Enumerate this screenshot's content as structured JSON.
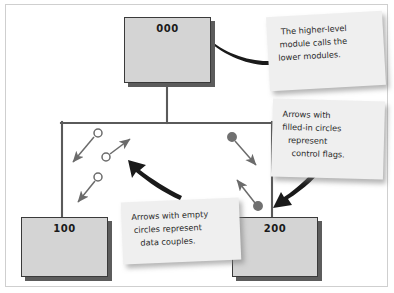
{
  "diagram": {
    "colors": {
      "box_fill": "#d4d4d4",
      "box_border": "#3a3a3a",
      "box_shadow": "#5c5c5c",
      "note_fill": "#efefef",
      "connector": "#5a5a5a",
      "callout_arrow": "#1a1a1a",
      "coupling_arrow": "#6b6b6b",
      "filled_circle": "#707070",
      "empty_circle": "#ffffff"
    },
    "modules": [
      {
        "id": "module-000",
        "label": "000",
        "x": 124,
        "y": 17,
        "w": 87,
        "h": 66
      },
      {
        "id": "module-100",
        "label": "100",
        "x": 21,
        "y": 217,
        "w": 87,
        "h": 60
      },
      {
        "id": "module-200",
        "label": "200",
        "x": 232,
        "y": 217,
        "w": 86,
        "h": 60
      }
    ],
    "connectors": [
      {
        "name": "parent-stem",
        "from": [
          167,
          83
        ],
        "to": [
          167,
          123
        ]
      },
      {
        "name": "horizontal-bus",
        "from": [
          62,
          123
        ],
        "to": [
          272,
          123
        ]
      },
      {
        "name": "branch-to-100",
        "from": [
          62,
          123
        ],
        "to": [
          62,
          217
        ]
      },
      {
        "name": "branch-to-200",
        "from": [
          272,
          123
        ],
        "to": [
          272,
          217
        ]
      }
    ],
    "data_couples": [
      {
        "name": "data-couple-1",
        "circle": [
          97,
          134
        ],
        "tip": [
          70,
          165
        ]
      },
      {
        "name": "data-couple-2",
        "circle": [
          107,
          157
        ],
        "tip": [
          133,
          136
        ]
      },
      {
        "name": "data-couple-3",
        "circle": [
          98,
          178
        ],
        "tip": [
          75,
          205
        ]
      }
    ],
    "control_flags": [
      {
        "name": "control-flag-1",
        "circle": [
          232,
          137
        ],
        "tip": [
          259,
          168
        ]
      },
      {
        "name": "control-flag-2",
        "circle": [
          258,
          207
        ],
        "tip": [
          234,
          177
        ]
      }
    ],
    "notes": [
      {
        "id": "note-top",
        "lines": [
          "The higher-level",
          "module calls the",
          "lower modules."
        ]
      },
      {
        "id": "note-right",
        "lines": [
          "Arrows with",
          "filled-in circles",
          "represent",
          "control flags."
        ]
      },
      {
        "id": "note-bottom",
        "lines": [
          "Arrows with empty",
          "circles represent",
          "data couples."
        ]
      }
    ]
  }
}
